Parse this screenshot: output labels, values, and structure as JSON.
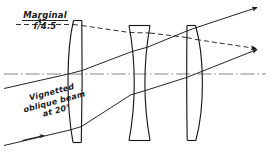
{
  "figure": {
    "type": "optical-ray-diagram",
    "width": 270,
    "height": 164,
    "background_color": "#ffffff",
    "ink_color": "#1a1a1a"
  },
  "labels": {
    "marginal": "Marginal",
    "fnumber": "f/4.5",
    "vignetted_line1": "Vignetted",
    "vignetted_line2": "oblique  beam",
    "vignetted_line3": "at 20°"
  },
  "optical_axis": {
    "name": "optical-axis",
    "style": "chain-dash-dot",
    "y": 74,
    "x_start": 4,
    "x_end": 266
  },
  "elements": [
    {
      "name": "lens-element-1",
      "index": 1,
      "shape": "meniscus",
      "x_left": 66,
      "x_right": 82,
      "y_top": 20,
      "y_bottom": 143
    },
    {
      "name": "lens-element-2",
      "index": 2,
      "shape": "biconcave",
      "x_left": 128,
      "x_right": 150,
      "y_top": 25,
      "y_bottom": 141
    },
    {
      "name": "lens-element-3",
      "index": 3,
      "shape": "meniscus",
      "x_left": 186,
      "x_right": 205,
      "y_top": 25,
      "y_bottom": 141
    }
  ],
  "rays": [
    {
      "name": "ray-marginal-upper",
      "style": "dashed",
      "arrow": true,
      "description": "Marginal f/4.5 ray entering horizontally at top, exiting upward to right"
    },
    {
      "name": "ray-oblique-upper",
      "style": "solid",
      "arrow": true,
      "description": "Upper edge of vignetted oblique beam at 20 degrees"
    },
    {
      "name": "ray-oblique-lower",
      "style": "solid",
      "arrow": true,
      "description": "Lower edge of vignetted oblique beam at 20 degrees"
    },
    {
      "name": "ray-oblique-entry",
      "style": "solid",
      "arrow": true,
      "description": "Incoming oblique beam arrow at lower left"
    },
    {
      "name": "ray-marginal-pointer",
      "style": "solid",
      "arrow": true,
      "description": "Small arrow from Marginal label to the dashed marginal ray"
    }
  ]
}
